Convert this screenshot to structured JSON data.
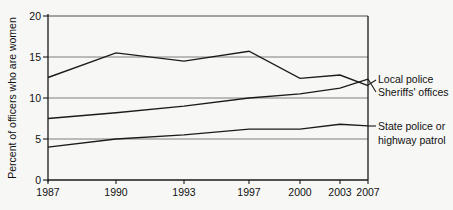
{
  "chart_data": {
    "type": "line",
    "title": "",
    "subtitle": "",
    "xlabel": "",
    "ylabel": "Percent of officers who are women",
    "x": [
      1987,
      1990,
      1993,
      1997,
      2000,
      2003,
      2007
    ],
    "xtick_labels": [
      "1987",
      "1990",
      "1993",
      "1997",
      "2000",
      "2003",
      "2007"
    ],
    "ytick_labels": [
      "0",
      "5",
      "10",
      "15",
      "20"
    ],
    "yticks": [
      0,
      5,
      10,
      15,
      20
    ],
    "ylim": [
      0,
      20
    ],
    "xlim": [
      1987,
      2007
    ],
    "grid": "horizontal",
    "legend_position": "right-inline-labels",
    "series": [
      {
        "name": "Local police",
        "values": [
          12.5,
          15.5,
          14.5,
          15.7,
          12.4,
          12.8,
          11.5
        ],
        "color": "#1b1b1b"
      },
      {
        "name": "Sheriffs' offices",
        "values": [
          7.5,
          8.2,
          9.0,
          10.0,
          10.5,
          11.2,
          12.3
        ],
        "color": "#1b1b1b"
      },
      {
        "name": "State police or highway patrol",
        "values": [
          4.0,
          5.0,
          5.5,
          6.2,
          6.2,
          6.8,
          6.6
        ],
        "color": "#1b1b1b"
      }
    ],
    "annotations": [
      {
        "text": "Local police",
        "series": "Local police"
      },
      {
        "text": "Sheriffs' offices",
        "series": "Sheriffs' offices"
      },
      {
        "text": "State police or",
        "series": "State police or highway patrol"
      },
      {
        "text": "highway patrol",
        "series": "State police or highway patrol"
      }
    ]
  },
  "axis": {
    "y_title": "Percent of officers who are women",
    "y_ticks": [
      "20",
      "15",
      "10",
      "5",
      "0"
    ],
    "x_ticks": [
      "1987",
      "1990",
      "1993",
      "1997",
      "2000",
      "2003",
      "2007"
    ]
  },
  "labels": {
    "local_police": "Local police",
    "sheriffs_offices": "Sheriffs' offices",
    "state_police_line1": "State police or",
    "state_police_line2": "highway patrol"
  },
  "colors": {
    "background": "#f7f7f5",
    "line": "#1b1b1b",
    "grid": "#6f6f6f",
    "axis": "#1a1a1a",
    "text": "#111111"
  }
}
